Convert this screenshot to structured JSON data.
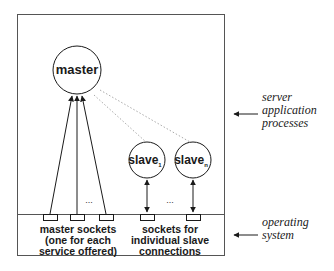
{
  "diagram": {
    "type": "architecture",
    "nodes": {
      "master": {
        "label": "master"
      },
      "slave_1": {
        "label": "slave",
        "subscript": "1"
      },
      "slave_n": {
        "label": "slave",
        "subscript": "n"
      }
    },
    "ellipsis": "...",
    "bottom_labels": {
      "master_sockets": [
        "master sockets",
        "(one for each",
        "service offered)"
      ],
      "slave_sockets": [
        "sockets for",
        "individual slave",
        "connections"
      ]
    },
    "side_labels": {
      "server": [
        "server",
        "application",
        "processes"
      ],
      "os": [
        "operating",
        "system"
      ]
    },
    "colors": {
      "line": "#1a1a1a",
      "box": "#555555",
      "dotted": "#aaaaaa"
    }
  }
}
